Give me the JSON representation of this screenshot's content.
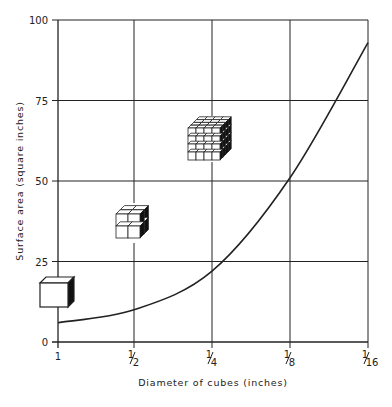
{
  "chart_data": {
    "type": "line",
    "title": "",
    "xlabel": "Diameter of cubes (inches)",
    "ylabel": "Surface area (square inches)",
    "x_tick_labels": [
      "1",
      "1/2",
      "1/4",
      "1/8",
      "1/16"
    ],
    "y_tick_labels": [
      "0",
      "25",
      "50",
      "75",
      "100"
    ],
    "ylim": [
      0,
      100
    ],
    "grid": true,
    "legend": null,
    "series": [
      {
        "name": "Total surface area of a 1-inch cube subdivided into smaller cubes",
        "x": [
          "1",
          "1/2",
          "1/4",
          "1/8",
          "1/16"
        ],
        "values": [
          6,
          10,
          22,
          51,
          93
        ]
      }
    ],
    "annotations": [
      {
        "type": "illustration",
        "label": "single cube (1 inch)",
        "near_x": "1",
        "near_y": 16
      },
      {
        "type": "illustration",
        "label": "2x2x2 cubes (1/2 inch)",
        "near_x": "1/2",
        "near_y": 37
      },
      {
        "type": "illustration",
        "label": "4x4x4 cubes (1/4 inch)",
        "near_x": "1/4",
        "near_y": 63
      }
    ]
  },
  "colors": {
    "ink": "#222222",
    "background": "#ffffff"
  }
}
